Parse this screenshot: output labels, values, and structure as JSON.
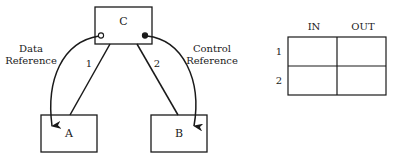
{
  "diagram": {
    "nodes": {
      "c": {
        "label": "C"
      },
      "a": {
        "label": "A"
      },
      "b": {
        "label": "B"
      }
    },
    "edges": {
      "c_a": {
        "label": "1"
      },
      "c_b": {
        "label": "2"
      }
    },
    "references": {
      "data": {
        "line1": "Data",
        "line2": "Reference",
        "connector": "open-circle"
      },
      "control": {
        "line1": "Control",
        "line2": "Reference",
        "connector": "filled-circle"
      }
    }
  },
  "table": {
    "columns": [
      "IN",
      "OUT"
    ],
    "rows": [
      "1",
      "2"
    ],
    "cells": [
      [
        "",
        ""
      ],
      [
        "",
        ""
      ]
    ]
  }
}
